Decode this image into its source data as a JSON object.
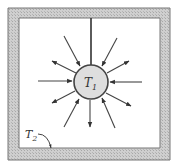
{
  "diagram": {
    "type": "radiation-exchange-sphere-in-enclosure",
    "colors": {
      "background": "#ffffff",
      "wall_fill": "#c8c8c8",
      "wall_stroke": "#666666",
      "sphere_fill": "#dedede",
      "sphere_stroke": "#444444",
      "arrow": "#444444",
      "label": "#333333"
    },
    "enclosure": {
      "outer": {
        "x": 8,
        "y": 8,
        "w": 162,
        "h": 152
      },
      "inner": {
        "x": 19,
        "y": 18,
        "w": 141,
        "h": 130
      },
      "label": {
        "main": "T",
        "sub": "2",
        "x": 25,
        "y": 138
      },
      "pointer": {
        "from": [
          38,
          134
        ],
        "ctrl": [
          48,
          134
        ],
        "to": [
          51,
          148
        ]
      }
    },
    "sphere": {
      "cx": 91,
      "cy": 82,
      "r": 17,
      "label": {
        "main": "T",
        "sub": "1",
        "x": 84,
        "y": 87
      }
    },
    "support_line": {
      "x": 91,
      "y1": 18,
      "y2": 65
    },
    "arrows": [
      {
        "id": "right-in",
        "x1": 142,
        "y1": 82,
        "x2": 110,
        "y2": 82,
        "direction": "inward"
      },
      {
        "id": "left-in",
        "x1": 38,
        "y1": 81,
        "x2": 72,
        "y2": 81,
        "direction": "inward"
      },
      {
        "id": "upper-left-in",
        "x1": 64,
        "y1": 36,
        "x2": 80,
        "y2": 66,
        "direction": "inward"
      },
      {
        "id": "upper-left-out",
        "x1": 76,
        "y1": 73,
        "x2": 52,
        "y2": 61,
        "direction": "outward"
      },
      {
        "id": "upper-right-in",
        "x1": 117,
        "y1": 38,
        "x2": 102,
        "y2": 66,
        "direction": "inward"
      },
      {
        "id": "upper-right-out",
        "x1": 107,
        "y1": 73,
        "x2": 129,
        "y2": 61,
        "direction": "outward"
      },
      {
        "id": "lower-left-out",
        "x1": 75,
        "y1": 91,
        "x2": 52,
        "y2": 103,
        "direction": "outward"
      },
      {
        "id": "lower-left-in",
        "x1": 64,
        "y1": 127,
        "x2": 79,
        "y2": 99,
        "direction": "inward"
      },
      {
        "id": "down-out",
        "x1": 90,
        "y1": 100,
        "x2": 90,
        "y2": 127,
        "direction": "outward"
      },
      {
        "id": "lower-right-in",
        "x1": 115,
        "y1": 128,
        "x2": 102,
        "y2": 98,
        "direction": "inward"
      },
      {
        "id": "lower-right-out",
        "x1": 106,
        "y1": 93,
        "x2": 131,
        "y2": 106,
        "direction": "outward"
      }
    ]
  }
}
